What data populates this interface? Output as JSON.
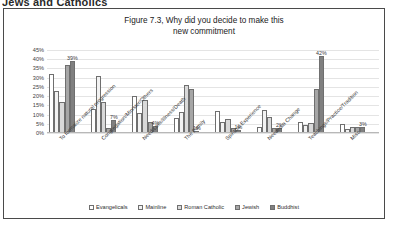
{
  "page": {
    "header_text": "Jews and Catholics"
  },
  "figure": {
    "title_line1": "Figure 7.3, Why did you decide to make this",
    "title_line2": "new commitment"
  },
  "chart_data": {
    "type": "bar",
    "title": "Figure 7.3, Why did you decide to make this new commitment",
    "xlabel": "",
    "ylabel": "",
    "ylim": [
      0,
      45
    ],
    "grid": true,
    "legend_position": "bottom",
    "ytick_labels": [
      "45%",
      "40%",
      "35%",
      "30%",
      "25%",
      "20%",
      "15%",
      "10%",
      "5%",
      "0%"
    ],
    "ytick_values": [
      45,
      40,
      35,
      30,
      25,
      20,
      15,
      10,
      5,
      0
    ],
    "categories": [
      "To formalize natural progression",
      "Congregation/Minister/Others",
      "Need/Loss/Illness/Death",
      "The Family",
      "Spiritual Experience",
      "Needed a Change",
      "Teachings/Practice/Tradition",
      "Misc"
    ],
    "series": [
      {
        "name": "Evangelicals",
        "color": "#ffffff",
        "values": [
          32,
          13,
          20,
          8,
          12,
          3.5,
          6,
          5
        ]
      },
      {
        "name": "Mainline",
        "color": "#f2f2f2",
        "values": [
          23,
          31,
          11,
          11.5,
          6,
          12.5,
          4.5,
          2
        ]
      },
      {
        "name": "Roman Catholic",
        "color": "#d9d9d9",
        "values": [
          17,
          17,
          18,
          26,
          7.5,
          8.5,
          5.5,
          3.5
        ]
      },
      {
        "name": "Jewish",
        "color": "#a6a6a6",
        "values": [
          37,
          2.5,
          6,
          24,
          2.5,
          2.5,
          24,
          3
        ]
      },
      {
        "name": "Buddhist",
        "color": "#808080",
        "values": [
          39,
          7,
          4,
          1,
          1.5,
          2.5,
          42,
          3
        ]
      }
    ],
    "data_labels": [
      {
        "group": 0,
        "series": 4,
        "text": "39%"
      },
      {
        "group": 1,
        "series": 4,
        "text": "7%"
      },
      {
        "group": 2,
        "series": 4,
        "text": "4%"
      },
      {
        "group": 3,
        "series": 4,
        "text": "1%"
      },
      {
        "group": 4,
        "series": 4,
        "text": "1%"
      },
      {
        "group": 5,
        "series": 4,
        "text": "2%"
      },
      {
        "group": 6,
        "series": 4,
        "text": "42%"
      },
      {
        "group": 7,
        "series": 4,
        "text": "3%"
      }
    ]
  }
}
